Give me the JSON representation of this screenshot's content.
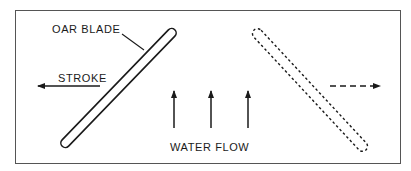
{
  "diagram": {
    "labels": {
      "oar_blade": "OAR BLADE",
      "stroke": "STROKE",
      "water_flow": "WATER FLOW"
    },
    "elements": {
      "solid_oar": "oar blade (current position, solid outline)",
      "dashed_oar": "oar blade (alternate position, dashed outline)",
      "stroke_arrow": "left-pointing arrow (stroke direction)",
      "return_arrow": "right-pointing dashed arrow",
      "water_flow_arrows": 3
    },
    "colors": {
      "ink": "#1a1a1a",
      "frame": "#555555",
      "background": "#ffffff"
    }
  }
}
